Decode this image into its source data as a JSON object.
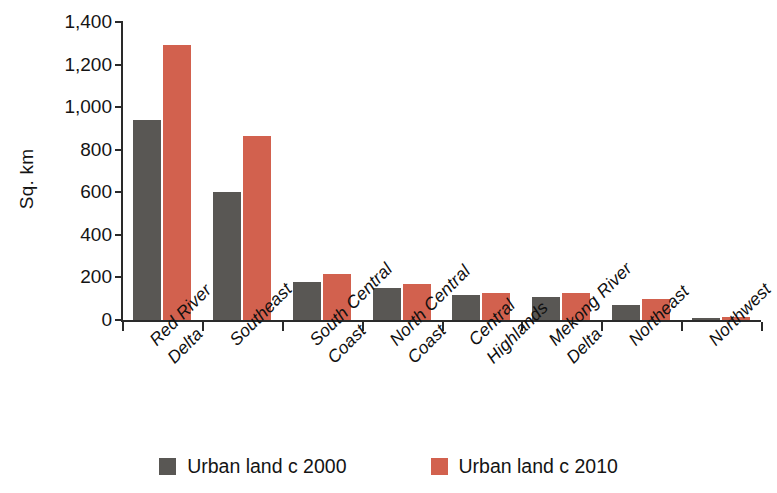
{
  "chart_data": {
    "type": "bar",
    "title": "",
    "subtitle": "",
    "xlabel": "",
    "ylabel": "Sq. km",
    "ylim": [
      0,
      1400
    ],
    "ytick_values": [
      0,
      200,
      400,
      600,
      800,
      1000,
      1200,
      1400
    ],
    "ytick_labels": [
      "0",
      "200",
      "400",
      "600",
      "800",
      "1,000",
      "1,200",
      "1,400"
    ],
    "grid": false,
    "legend_position": "bottom-center",
    "categories": [
      "Red River Delta",
      "Southeast",
      "South Central Coast",
      "North Central Coast",
      "Central Highlands",
      "Mekong River Delta",
      "Northeast",
      "Northwest"
    ],
    "category_label_lines": [
      [
        "Red River",
        "Delta"
      ],
      [
        "Southeast"
      ],
      [
        "South Central",
        "Coast"
      ],
      [
        "North Central",
        "Coast"
      ],
      [
        "Central",
        "Highlands"
      ],
      [
        "Mekong River",
        "Delta"
      ],
      [
        "Northeast"
      ],
      [
        "Northwest"
      ]
    ],
    "series": [
      {
        "name": "Urban land c 2000",
        "color": "#595754",
        "values": [
          940,
          600,
          178,
          150,
          118,
          110,
          72,
          10
        ]
      },
      {
        "name": "Urban land c 2010",
        "color": "#d2614e",
        "values": [
          1290,
          863,
          215,
          168,
          128,
          127,
          97,
          15
        ]
      }
    ]
  },
  "legend": {
    "items": [
      {
        "label": "Urban land c 2000",
        "color": "#595754"
      },
      {
        "label": "Urban land c 2010",
        "color": "#d2614e"
      }
    ]
  },
  "axes": {
    "y_title": "Sq. km"
  }
}
